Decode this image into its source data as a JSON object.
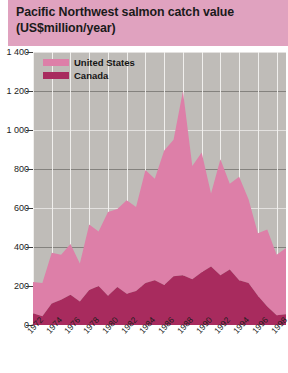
{
  "title": {
    "line1": "Pacific Northwest salmon catch value",
    "line2": "(US$million/year)",
    "banner_color": "#e0a2bf"
  },
  "legend": {
    "position": "top-left",
    "items": [
      {
        "label": "United States",
        "color": "#dd7fa8",
        "swatch_name": "legend-swatch-united-states"
      },
      {
        "label": "Canada",
        "color": "#a8२b5e",
        "swatch_name": "legend-swatch-canada"
      }
    ]
  },
  "caption": {
    "text": ""
  },
  "chart_data": {
    "type": "area",
    "stacked": true,
    "title": "Pacific Northwest salmon catch value (US$million/year)",
    "subtitle": "",
    "xlabel": "",
    "ylabel": "US$million/year",
    "ylim": [
      0,
      1400
    ],
    "ytick_step": 200,
    "ytick_labels": [
      "0",
      "200",
      "400",
      "600",
      "800",
      "1 000",
      "1 200",
      "1 400"
    ],
    "ytick_values": [
      0,
      200,
      400,
      600,
      800,
      1000,
      1200,
      1400
    ],
    "xlim": [
      1972,
      1999
    ],
    "xtick_labels": [
      "1972",
      "1974",
      "1976",
      "1978",
      "1980",
      "1982",
      "1984",
      "1986",
      "1988",
      "1990",
      "1992",
      "1994",
      "1996",
      "1998"
    ],
    "xtick_values": [
      1972,
      1974,
      1976,
      1978,
      1980,
      1982,
      1984,
      1986,
      1988,
      1990,
      1992,
      1994,
      1996,
      1998
    ],
    "grid": true,
    "legend_position": "top-left",
    "x": [
      1972,
      1973,
      1974,
      1975,
      1976,
      1977,
      1978,
      1979,
      1980,
      1981,
      1982,
      1983,
      1984,
      1985,
      1986,
      1987,
      1988,
      1989,
      1990,
      1991,
      1992,
      1993,
      1994,
      1995,
      1996,
      1997,
      1998,
      1999
    ],
    "series": [
      {
        "name": "Canada",
        "color": "#a82b5e",
        "values": [
          60,
          45,
          110,
          130,
          155,
          120,
          180,
          200,
          150,
          195,
          160,
          175,
          215,
          230,
          205,
          250,
          255,
          235,
          270,
          300,
          255,
          285,
          230,
          215,
          150,
          95,
          50,
          55
        ]
      },
      {
        "name": "United States",
        "color": "#dd7fa8",
        "values": [
          160,
          170,
          260,
          230,
          260,
          195,
          335,
          280,
          430,
          400,
          480,
          430,
          580,
          520,
          690,
          700,
          945,
          580,
          615,
          375,
          595,
          440,
          530,
          430,
          320,
          395,
          310,
          340
        ]
      }
    ],
    "totals": [
      220,
      215,
      370,
      360,
      415,
      315,
      515,
      480,
      580,
      595,
      640,
      605,
      795,
      750,
      895,
      950,
      1200,
      815,
      885,
      675,
      850,
      725,
      760,
      645,
      470,
      490,
      360,
      395
    ]
  }
}
